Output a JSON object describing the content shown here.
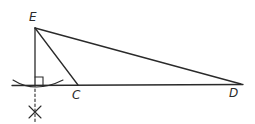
{
  "diagram": {
    "type": "geometric construction",
    "points": {
      "E": {
        "label": "E",
        "x": 35,
        "y": 28
      },
      "C": {
        "label": "C",
        "x": 78,
        "y": 85
      },
      "D": {
        "label": "D",
        "x": 241,
        "y": 84
      },
      "F": {
        "label": "",
        "x": 35,
        "y": 86
      }
    },
    "segments": [
      "EC",
      "ED",
      "CD",
      "EF"
    ],
    "marks": [
      "right-angle at foot of perpendicular",
      "compass arc through line",
      "construction X below line",
      "dashed extension of perpendicular"
    ],
    "colors": {
      "line": "#2a2a2a",
      "background": "#ffffff"
    }
  }
}
